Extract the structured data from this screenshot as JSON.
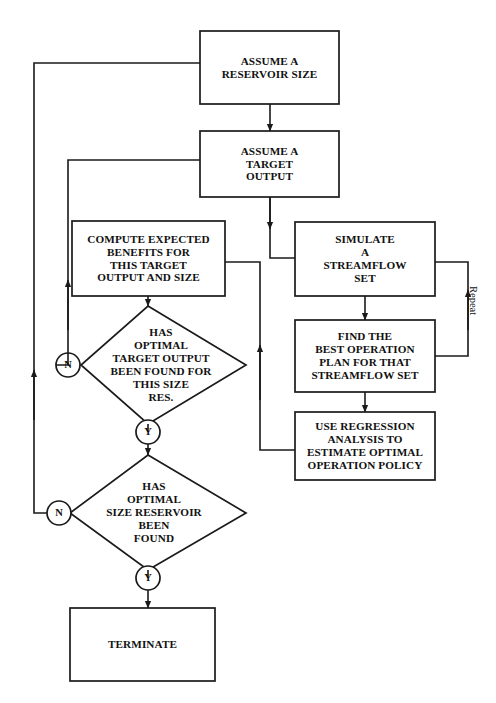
{
  "diagram": {
    "stroke_color": "#1a1a1a",
    "fill_color": "#ffffff",
    "nodes": [
      {
        "id": "assume-reservoir-size",
        "type": "process",
        "text": "ASSUME A\nRESERVOIR SIZE"
      },
      {
        "id": "assume-target-output",
        "type": "process",
        "text": "ASSUME A\nTARGET\nOUTPUT"
      },
      {
        "id": "compute-expected-benefits",
        "type": "process",
        "text": "COMPUTE EXPECTED\nBENEFITS FOR\nTHIS TARGET\nOUTPUT AND SIZE"
      },
      {
        "id": "simulate-streamflow-set",
        "type": "process",
        "text": "SIMULATE\nA\nSTREAMFLOW\nSET"
      },
      {
        "id": "find-best-operation-plan",
        "type": "process",
        "text": "FIND THE\nBEST OPERATION\nPLAN FOR THAT\nSTREAMFLOW SET"
      },
      {
        "id": "use-regression-analysis",
        "type": "process",
        "text": "USE REGRESSION\nANALYSIS TO\nESTIMATE OPTIMAL\nOPERATION POLICY"
      },
      {
        "id": "decision-target-output",
        "type": "decision",
        "text": "HAS\nOPTIMAL\nTARGET OUTPUT\nBEEN FOUND FOR\nTHIS SIZE\nRES."
      },
      {
        "id": "decision-size-reservoir",
        "type": "decision",
        "text": "HAS\nOPTIMAL\nSIZE RESERVOIR\nBEEN\nFOUND"
      },
      {
        "id": "terminate",
        "type": "process",
        "text": "TERMINATE"
      }
    ],
    "connectors": [
      {
        "id": "target-output-no",
        "label": "N"
      },
      {
        "id": "target-output-yes",
        "label": "Y"
      },
      {
        "id": "size-reservoir-no",
        "label": "N"
      },
      {
        "id": "size-reservoir-yes",
        "label": "Y"
      }
    ],
    "edge_labels": [
      {
        "id": "repeat-loop-label",
        "text": "Repeat"
      }
    ]
  }
}
